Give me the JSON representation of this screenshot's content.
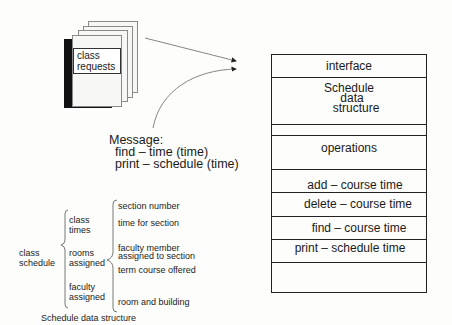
{
  "documents": {
    "label_line1": "class",
    "label_line2": "requests",
    "stack_count": 5
  },
  "message": {
    "title": "Message:",
    "lines": [
      "find – time (time)",
      "print – schedule (time)"
    ]
  },
  "module": {
    "rows": [
      {
        "label": "interface"
      },
      {
        "label_lines": [
          "Schedule",
          "data",
          "structure"
        ]
      },
      {
        "label": ""
      },
      {
        "label": "operations"
      },
      {
        "label": "add – course time"
      },
      {
        "label": "delete – course time"
      },
      {
        "label": "find – course time"
      },
      {
        "label": "print – schedule time"
      },
      {
        "label": ""
      }
    ]
  },
  "data_structure": {
    "root": {
      "line1": "class",
      "line2": "schedule"
    },
    "groups": [
      {
        "line1": "class",
        "line2": "times"
      },
      {
        "line1": "rooms",
        "line2": "assigned"
      },
      {
        "line1": "faculty",
        "line2": "assigned"
      }
    ],
    "fields": [
      "section number",
      "time for section",
      "faculty member",
      "assigned to section",
      "term course offered",
      "room and building"
    ],
    "caption": "Schedule data structure"
  }
}
